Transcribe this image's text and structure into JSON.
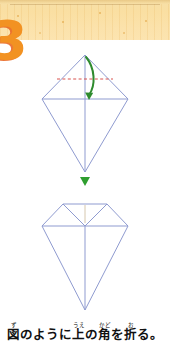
{
  "page": {
    "width": 170,
    "height": 345,
    "background": "#ffffff"
  },
  "banner": {
    "name": "wood-texture-banner",
    "base_color": "#fadfa2",
    "top_edge_color": "#e9c886",
    "dot_color": "#e2a646",
    "height": 40
  },
  "step": {
    "number": "3",
    "color": "#f29222",
    "shadow_color": "#e86018"
  },
  "diagrams": {
    "line_color": "#8f9bd0",
    "fold_line_color": "#d9534f",
    "arrow_color": "#2e8b2e",
    "top": {
      "name": "kite-before-fold",
      "fold_line_style": "dashed",
      "arrow_style": "curved-fold-arrow"
    },
    "transition_arrow": {
      "name": "down-triangle-arrow",
      "color": "#2f9e2f"
    },
    "bottom": {
      "name": "kite-after-fold",
      "description": "top corner folded down"
    }
  },
  "caption": {
    "full_text": "図のように上の角を折る。",
    "segments": [
      {
        "base": "図",
        "ruby": "ず"
      },
      {
        "base": "のように",
        "ruby": ""
      },
      {
        "base": "上",
        "ruby": "うえ"
      },
      {
        "base": "の",
        "ruby": ""
      },
      {
        "base": "角",
        "ruby": "かど"
      },
      {
        "base": "を",
        "ruby": ""
      },
      {
        "base": "折",
        "ruby": "お"
      },
      {
        "base": "る。",
        "ruby": ""
      }
    ]
  }
}
